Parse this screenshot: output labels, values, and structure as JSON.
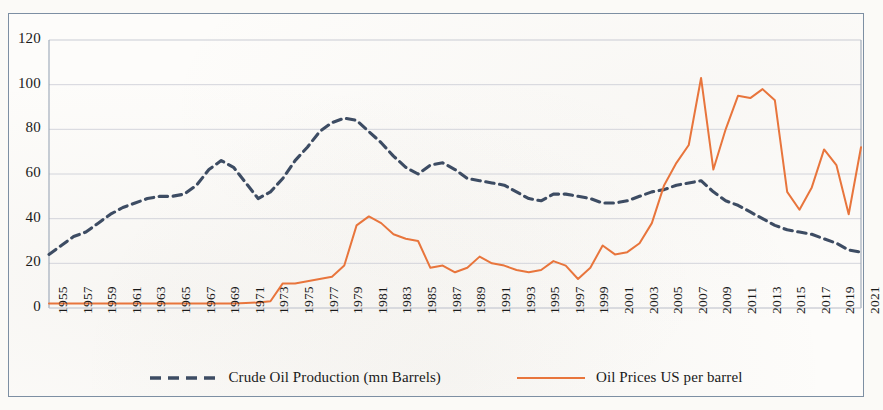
{
  "chart_data": {
    "type": "line",
    "title": "",
    "xlabel": "",
    "ylabel": "",
    "ylim": [
      0,
      120
    ],
    "ytick_values": [
      0,
      20,
      40,
      60,
      80,
      100,
      120
    ],
    "ytick_labels": [
      "0",
      "20",
      "40",
      "60",
      "80",
      "100",
      "120"
    ],
    "grid": true,
    "legend_position": "bottom",
    "x": [
      1955,
      1956,
      1957,
      1958,
      1959,
      1960,
      1961,
      1962,
      1963,
      1964,
      1965,
      1966,
      1967,
      1968,
      1969,
      1970,
      1971,
      1972,
      1973,
      1974,
      1975,
      1976,
      1977,
      1978,
      1979,
      1980,
      1981,
      1982,
      1983,
      1984,
      1985,
      1986,
      1987,
      1988,
      1989,
      1990,
      1991,
      1992,
      1993,
      1994,
      1995,
      1996,
      1997,
      1998,
      1999,
      2000,
      2001,
      2002,
      2003,
      2004,
      2005,
      2006,
      2007,
      2008,
      2009,
      2010,
      2011,
      2012,
      2013,
      2014,
      2015,
      2016,
      2017,
      2018,
      2019,
      2020,
      2021
    ],
    "xtick_labels": [
      "1955",
      "1957",
      "1959",
      "1961",
      "1963",
      "1965",
      "1967",
      "1969",
      "1971",
      "1973",
      "1975",
      "1977",
      "1979",
      "1981",
      "1983",
      "1985",
      "1987",
      "1989",
      "1991",
      "1993",
      "1995",
      "1997",
      "1999",
      "2001",
      "2003",
      "2005",
      "2007",
      "2009",
      "2011",
      "2013",
      "2015",
      "2017",
      "2019",
      "2021"
    ],
    "series": [
      {
        "name": "Crude Oil Production (mn Barrels)",
        "color": "#3d4c63",
        "style": "dashed",
        "values": [
          24,
          28,
          32,
          34,
          38,
          42,
          45,
          47,
          49,
          50,
          50,
          51,
          55,
          62,
          66,
          63,
          56,
          49,
          52,
          58,
          66,
          72,
          79,
          83,
          85,
          84,
          79,
          74,
          68,
          63,
          60,
          64,
          65,
          62,
          58,
          57,
          56,
          55,
          52,
          49,
          48,
          51,
          51,
          50,
          49,
          47,
          47,
          48,
          50,
          52,
          53,
          55,
          56,
          57,
          52,
          48,
          46,
          43,
          40,
          37,
          35,
          34,
          33,
          31,
          29,
          26,
          25
        ]
      },
      {
        "name": "Oil Prices US per barrel",
        "color": "#e8753c",
        "style": "solid",
        "values": [
          2,
          2,
          2,
          2,
          2,
          2,
          2,
          2,
          2,
          2,
          2,
          2,
          2,
          2,
          2,
          2,
          2.2,
          2.5,
          3,
          11,
          11,
          12,
          13,
          14,
          19,
          37,
          41,
          38,
          33,
          31,
          30,
          18,
          19,
          16,
          18,
          23,
          20,
          19,
          17,
          16,
          17,
          21,
          19,
          13,
          18,
          28,
          24,
          25,
          29,
          38,
          55,
          65,
          73,
          103,
          62,
          80,
          95,
          94,
          98,
          93,
          52,
          44,
          54,
          71,
          64,
          42,
          72
        ]
      }
    ],
    "annotations": []
  },
  "legend": {
    "items": [
      {
        "label": "Crude Oil Production (mn Barrels)",
        "color": "#3d4c63",
        "style": "dashed",
        "icon": "dashed-line-swatch"
      },
      {
        "label": "Oil Prices US per barrel",
        "color": "#e8753c",
        "style": "solid",
        "icon": "solid-line-swatch"
      }
    ]
  }
}
